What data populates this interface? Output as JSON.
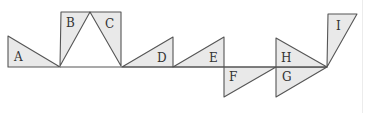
{
  "diagram": {
    "type": "triangle-sequence",
    "colors": {
      "fill": "#e9e9e9",
      "stroke": "#555555",
      "label": "#333333"
    },
    "baseline_y": 67,
    "triangles": [
      {
        "label": "A",
        "points": "8,36 8,67 60,67",
        "label_pos": [
          14,
          61
        ]
      },
      {
        "label": "B",
        "points": "61,12 90,12 60,66",
        "label_pos": [
          66,
          27
        ]
      },
      {
        "label": "C",
        "points": "90,12 121,12 121,66",
        "label_pos": [
          105,
          28
        ]
      },
      {
        "label": "D",
        "points": "122,67 173,37 173,67",
        "label_pos": [
          157,
          62
        ]
      },
      {
        "label": "E",
        "points": "173,67 224,37 224,67",
        "label_pos": [
          209,
          62
        ]
      },
      {
        "label": "F",
        "points": "224,67 276,67 224,97",
        "label_pos": [
          229,
          81
        ]
      },
      {
        "label": "G",
        "points": "276,67 327,67 276,97",
        "label_pos": [
          282,
          81
        ]
      },
      {
        "label": "H",
        "points": "276,38 276,67 327,67",
        "label_pos": [
          281,
          62
        ]
      },
      {
        "label": "I",
        "points": "328,14 357,14 327,67",
        "label_pos": [
          336,
          30
        ]
      }
    ]
  }
}
